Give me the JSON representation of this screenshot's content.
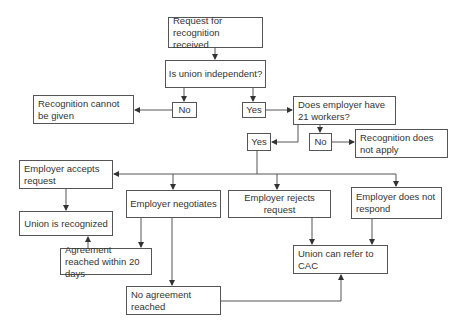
{
  "diagram": {
    "type": "flowchart",
    "colors": {
      "line": "#555555",
      "text": "#333333",
      "background": "#ffffff"
    },
    "nodes": {
      "request": "Request for recognition received",
      "independent": "Is union independent?",
      "no1": "No",
      "yes1": "Yes",
      "cannot_be_given": "Recognition cannot be given",
      "employer_21": "Does employer have 21 workers?",
      "yes2": "Yes",
      "no2": "No",
      "does_not_apply": "Recognition does not apply",
      "accepts": "Employer accepts request",
      "negotiates": "Employer negotiates",
      "rejects": "Employer rejects request",
      "no_response": "Employer does not respond",
      "recognized": "Union is recognized",
      "agreement_20": "Agreement reached within 20 days",
      "no_agreement": "No agreement reached",
      "refer_cac": "Union can refer to CAC"
    },
    "edges": [
      [
        "request",
        "independent"
      ],
      [
        "independent",
        "no1"
      ],
      [
        "independent",
        "yes1"
      ],
      [
        "no1",
        "cannot_be_given"
      ],
      [
        "yes1",
        "employer_21"
      ],
      [
        "employer_21",
        "yes2"
      ],
      [
        "employer_21",
        "no2"
      ],
      [
        "no2",
        "does_not_apply"
      ],
      [
        "yes2",
        "accepts"
      ],
      [
        "yes2",
        "negotiates"
      ],
      [
        "yes2",
        "rejects"
      ],
      [
        "yes2",
        "no_response"
      ],
      [
        "accepts",
        "recognized"
      ],
      [
        "negotiates",
        "agreement_20"
      ],
      [
        "negotiates",
        "no_agreement"
      ],
      [
        "agreement_20",
        "recognized"
      ],
      [
        "rejects",
        "refer_cac"
      ],
      [
        "no_response",
        "refer_cac"
      ],
      [
        "no_agreement",
        "refer_cac"
      ]
    ]
  }
}
